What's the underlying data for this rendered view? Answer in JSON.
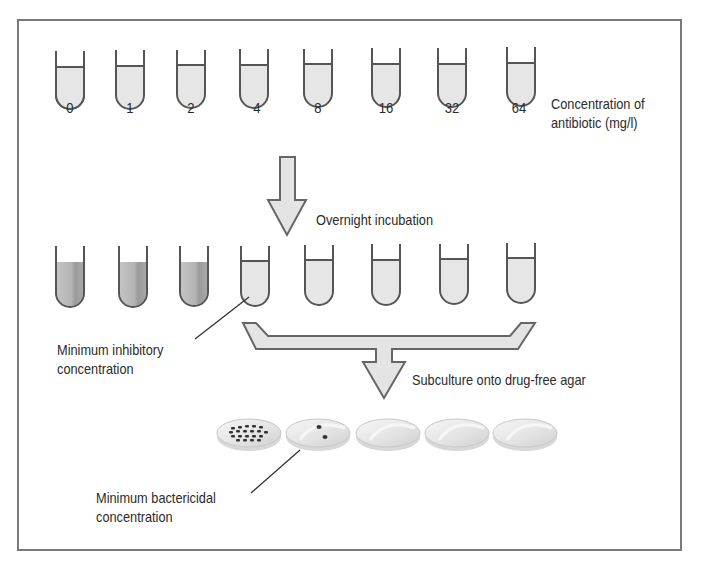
{
  "figure": {
    "colors": {
      "border": "#7a7a7a",
      "tube_outline": "#555555",
      "clear_broth": "#e6e6e6",
      "turbid_broth": "#b8b8b8",
      "turbid_streak": "#9e9e9e",
      "arrow_fill": "#e4e4e4",
      "arrow_stroke": "#666666",
      "plate": "#ececec",
      "colony": "#333333"
    }
  },
  "row1": {
    "concentrations": [
      "0",
      "1",
      "2",
      "4",
      "8",
      "16",
      "32",
      "64"
    ],
    "label_line1": "Concentration of",
    "label_line2": "antibiotic (mg/l)"
  },
  "step1": {
    "label": "Overnight incubation"
  },
  "row2": {
    "tube_states": [
      "turbid",
      "turbid",
      "turbid",
      "clear",
      "clear",
      "clear",
      "clear",
      "clear"
    ],
    "mic_label_line1": "Minimum inhibitory",
    "mic_label_line2": "concentration",
    "mic_tube_index": 3
  },
  "step2": {
    "label": "Subculture onto drug-free agar"
  },
  "plates": {
    "states": [
      "many colonies",
      "2 colonies",
      "no growth",
      "no growth",
      "no growth"
    ],
    "mbc_label_line1": "Minimum bactericidal",
    "mbc_label_line2": "concentration",
    "mbc_plate_index": 1
  }
}
